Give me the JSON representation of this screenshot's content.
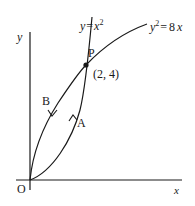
{
  "diagram": {
    "axes": {
      "x_label": "x",
      "y_label": "y",
      "origin_label": "O"
    },
    "curves": [
      {
        "name": "parabola-y-equals-x-squared",
        "equation_lhs": "y",
        "equation_eq": "=",
        "equation_rhs_base": "x",
        "equation_rhs_exp": "2"
      },
      {
        "name": "parabola-y-squared-equals-8x",
        "equation_lhs_base": "y",
        "equation_lhs_exp": "2",
        "equation_eq": "=",
        "equation_rhs": "8",
        "equation_rhs_var": "x"
      }
    ],
    "intersection": {
      "label": "P",
      "coords": "(2, 4)"
    },
    "path_labels": {
      "lower_curve": "A",
      "upper_curve": "B"
    },
    "colors": {
      "ink": "#1a1a1a",
      "background": "#ffffff"
    }
  }
}
